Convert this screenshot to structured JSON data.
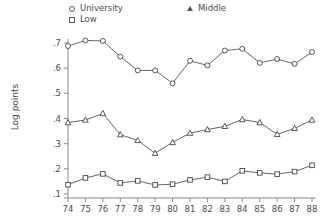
{
  "chart_data": {
    "type": "line",
    "title": "",
    "subtitle": "",
    "xlabel": "",
    "ylabel": "Log points",
    "x": [
      "74",
      "75",
      "76",
      "77",
      "78",
      "79",
      "80",
      "81",
      "82",
      "83",
      "84",
      "85",
      "86",
      "87",
      "88"
    ],
    "xlim": [
      0,
      14
    ],
    "ylim": [
      0.1,
      0.72
    ],
    "yticks": [
      ".1",
      ".2",
      ".3",
      ".4",
      ".5",
      ".6",
      ".7"
    ],
    "ytick_values": [
      0.1,
      0.2,
      0.3,
      0.4,
      0.5,
      0.6,
      0.7
    ],
    "grid": false,
    "legend_position": "top",
    "series": [
      {
        "name": "University",
        "marker": "circle",
        "color": "#555555",
        "values": [
          0.688,
          0.71,
          0.708,
          0.646,
          0.591,
          0.591,
          0.54,
          0.629,
          0.611,
          0.67,
          0.677,
          0.621,
          0.636,
          0.617,
          0.664
        ]
      },
      {
        "name": "Middle",
        "marker": "triangle",
        "color": "#555555",
        "values": [
          0.384,
          0.394,
          0.42,
          0.336,
          0.313,
          0.262,
          0.305,
          0.342,
          0.356,
          0.369,
          0.396,
          0.384,
          0.337,
          0.361,
          0.394
        ]
      },
      {
        "name": "Low",
        "marker": "square",
        "color": "#555555",
        "values": [
          0.137,
          0.164,
          0.18,
          0.144,
          0.152,
          0.136,
          0.139,
          0.156,
          0.167,
          0.15,
          0.192,
          0.184,
          0.179,
          0.189,
          0.214
        ]
      }
    ]
  },
  "legend": {
    "entries": [
      {
        "label": "University",
        "marker": "circle"
      },
      {
        "label": "Low",
        "marker": "square"
      },
      {
        "label": "Middle",
        "marker": "triangle"
      }
    ]
  },
  "axes": {
    "y_title": "Log points"
  }
}
